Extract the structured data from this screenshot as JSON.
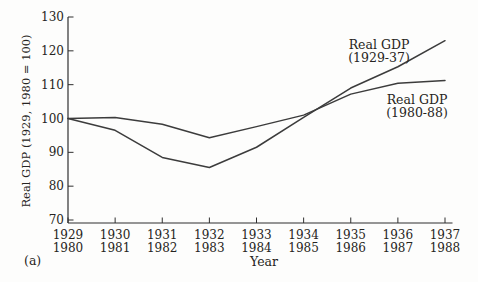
{
  "figure_label": "(a)",
  "colors": {
    "background": "#fdfdfc",
    "axis": "#2f2f2f",
    "line": "#3c3c3c",
    "text": "#262421"
  },
  "chart_data": {
    "type": "line",
    "title": "",
    "xlabel": "Year",
    "ylabel": "Real GDP (1929, 1980 = 100)",
    "ylim": [
      70,
      130
    ],
    "yticks": [
      130,
      120,
      110,
      100,
      90,
      80,
      70
    ],
    "grid": false,
    "legend": "inline-annotations",
    "x_tick_rows": [
      [
        "1929",
        "1930",
        "1931",
        "1932",
        "1933",
        "1934",
        "1935",
        "1936",
        "1937"
      ],
      [
        "1980",
        "1981",
        "1982",
        "1983",
        "1984",
        "1985",
        "1986",
        "1987",
        "1988"
      ]
    ],
    "series": [
      {
        "name": "Real GDP (1929-37)",
        "label_lines": [
          "Real GDP",
          "(1929-37)"
        ],
        "x": [
          1929,
          1930,
          1931,
          1932,
          1933,
          1934,
          1935,
          1936,
          1937
        ],
        "values": [
          100,
          96.5,
          88.5,
          85.5,
          91.5,
          100.3,
          109,
          115.3,
          123
        ]
      },
      {
        "name": "Real GDP (1980-88)",
        "label_lines": [
          "Real GDP",
          "(1980-88)"
        ],
        "x": [
          1980,
          1981,
          1982,
          1983,
          1984,
          1985,
          1986,
          1987,
          1988
        ],
        "values": [
          100,
          100.3,
          98.3,
          94.3,
          97.6,
          101,
          107.2,
          110.4,
          111.2
        ]
      }
    ]
  }
}
